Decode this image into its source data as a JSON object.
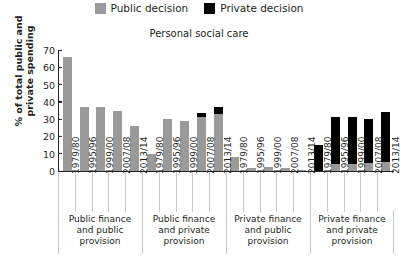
{
  "legend": {
    "items": [
      {
        "label": "Public decision",
        "color": "#9a9a9a",
        "icon": "square-swatch-icon"
      },
      {
        "label": "Private decision",
        "color": "#000000",
        "icon": "square-swatch-icon"
      }
    ]
  },
  "chart_data": {
    "type": "bar",
    "title": "Personal social care",
    "xlabel": "",
    "ylabel": "% of total public and private spending",
    "ylim": [
      0,
      70
    ],
    "yticks": [
      0,
      10,
      20,
      30,
      40,
      50,
      60,
      70
    ],
    "ytick_labels": [
      "0",
      "10",
      "20",
      "30",
      "40",
      "50",
      "60",
      "70"
    ],
    "grid": false,
    "legend_position": "top-center",
    "stacked": true,
    "colors": {
      "public": "#9a9a9a",
      "private": "#000000"
    },
    "categories": [
      "1979/80",
      "1995/96",
      "1999/00",
      "2007/08",
      "2013/14"
    ],
    "groups": [
      {
        "name": "Public finance and public provision",
        "caption_lines": [
          "Public finance",
          "and public",
          "provision"
        ],
        "bars": [
          {
            "category": "1979/80",
            "public": 66,
            "private": 0
          },
          {
            "category": "1995/96",
            "public": 37,
            "private": 0
          },
          {
            "category": "1999/00",
            "public": 37,
            "private": 0
          },
          {
            "category": "2007/08",
            "public": 35,
            "private": 0
          },
          {
            "category": "2013/14",
            "public": 26,
            "private": 0
          }
        ]
      },
      {
        "name": "Public finance and private provision",
        "caption_lines": [
          "Public finance",
          "and private",
          "provision"
        ],
        "bars": [
          {
            "category": "1979/80",
            "public": 10,
            "private": 0
          },
          {
            "category": "1995/96",
            "public": 30,
            "private": 0
          },
          {
            "category": "1999/00",
            "public": 29,
            "private": 0
          },
          {
            "category": "2007/08",
            "public": 31,
            "private": 2.5
          },
          {
            "category": "2013/14",
            "public": 33,
            "private": 4
          }
        ]
      },
      {
        "name": "Private finance and public provision",
        "caption_lines": [
          "Private finance",
          "and public",
          "provision"
        ],
        "bars": [
          {
            "category": "1979/80",
            "public": 8,
            "private": 0
          },
          {
            "category": "1995/96",
            "public": 2,
            "private": 0
          },
          {
            "category": "1999/00",
            "public": 2.5,
            "private": 0
          },
          {
            "category": "2007/08",
            "public": 1.5,
            "private": 0
          },
          {
            "category": "2013/14",
            "public": 0.8,
            "private": 0
          }
        ]
      },
      {
        "name": "Private finance and private provision",
        "caption_lines": [
          "Private finance",
          "and private",
          "provision"
        ],
        "bars": [
          {
            "category": "1979/80",
            "public": 0,
            "private": 15
          },
          {
            "category": "1995/96",
            "public": 4,
            "private": 27
          },
          {
            "category": "1999/00",
            "public": 4,
            "private": 27
          },
          {
            "category": "2007/08",
            "public": 4.5,
            "private": 25.5
          },
          {
            "category": "2013/14",
            "public": 5,
            "private": 29
          }
        ]
      }
    ]
  }
}
